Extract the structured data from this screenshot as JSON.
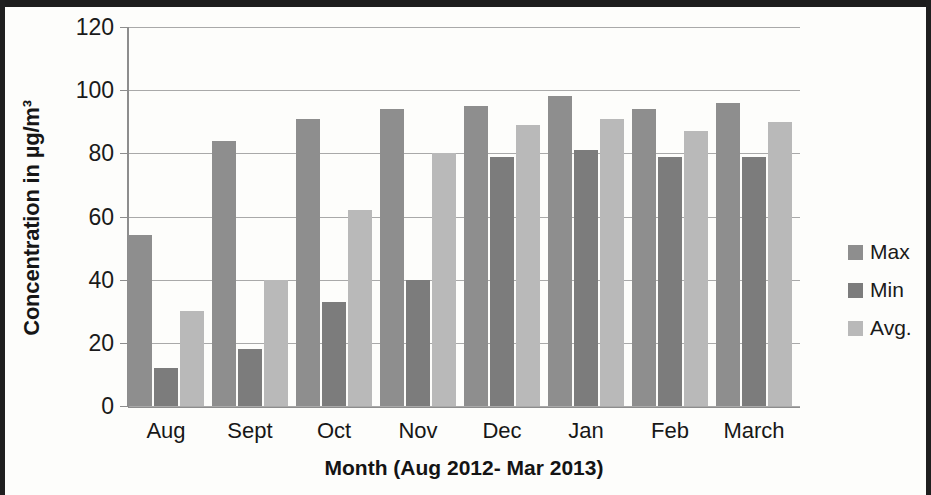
{
  "chart_data": {
    "type": "bar",
    "title": "",
    "xlabel": "Month (Aug 2012- Mar 2013)",
    "ylabel": "Concentration in µg/m³",
    "categories": [
      "Aug",
      "Sept",
      "Oct",
      "Nov",
      "Dec",
      "Jan",
      "Feb",
      "March"
    ],
    "series": [
      {
        "name": "Max",
        "color": "#8e8e8e",
        "values": [
          54,
          84,
          91,
          94,
          95,
          98,
          94,
          96
        ]
      },
      {
        "name": "Min",
        "color": "#7c7c7c",
        "values": [
          12,
          18,
          33,
          40,
          79,
          81,
          79,
          79
        ]
      },
      {
        "name": "Avg.",
        "color": "#b9b9b9",
        "values": [
          30,
          40,
          62,
          80,
          89,
          91,
          87,
          90
        ]
      }
    ],
    "ylim": [
      0,
      120
    ],
    "yticks": [
      0,
      20,
      40,
      60,
      80,
      100,
      120
    ],
    "ytick_labels": [
      "0",
      "20",
      "40",
      "60",
      "80",
      "100",
      "120"
    ],
    "grid": true,
    "legend_position": "right"
  },
  "legend": {
    "items": [
      {
        "label": "Max",
        "color": "#8e8e8e"
      },
      {
        "label": "Min",
        "color": "#7c7c7c"
      },
      {
        "label": "Avg.",
        "color": "#b9b9b9"
      }
    ]
  }
}
